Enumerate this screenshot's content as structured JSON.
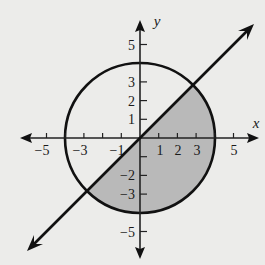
{
  "diagram": {
    "type": "coordinate-plane",
    "axes": {
      "x_label": "x",
      "y_label": "y",
      "x_ticks": [
        {
          "value": -5,
          "label": "−5"
        },
        {
          "value": -4,
          "label": ""
        },
        {
          "value": -3,
          "label": "−3"
        },
        {
          "value": -2,
          "label": ""
        },
        {
          "value": -1,
          "label": "−1"
        },
        {
          "value": 1,
          "label": "1"
        },
        {
          "value": 2,
          "label": "2"
        },
        {
          "value": 3,
          "label": "3"
        },
        {
          "value": 4,
          "label": ""
        },
        {
          "value": 5,
          "label": "5"
        }
      ],
      "y_ticks": [
        {
          "value": 5,
          "label": "5"
        },
        {
          "value": 3,
          "label": "3"
        },
        {
          "value": 2,
          "label": "2"
        },
        {
          "value": 1,
          "label": "1"
        },
        {
          "value": -1,
          "label": ""
        },
        {
          "value": -2,
          "label": "−2"
        },
        {
          "value": -3,
          "label": "−3"
        },
        {
          "value": -5,
          "label": "−5"
        }
      ]
    },
    "circle": {
      "center": [
        0,
        0
      ],
      "radius": 4,
      "equation": "x^2 + y^2 = 16"
    },
    "line": {
      "equation": "y = x",
      "arrows": "both"
    },
    "shaded_region": {
      "description": "portion of the disk below the line y = x",
      "fill": "#b9b9b9"
    },
    "colors": {
      "background": "#ececea",
      "stroke": "#111111",
      "shade": "#b9b9b9"
    }
  }
}
